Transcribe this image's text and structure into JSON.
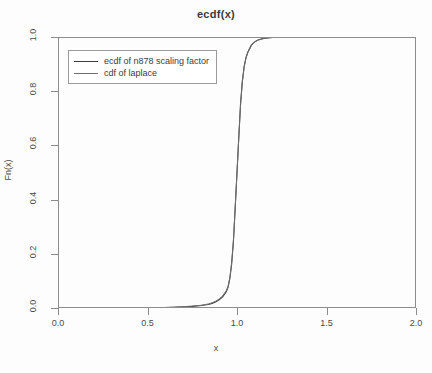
{
  "chart_data": {
    "type": "line",
    "title": "ecdf(x)",
    "xlabel": "x",
    "ylabel": "Fn(x)",
    "xlim": [
      0.0,
      2.0
    ],
    "ylim": [
      0.0,
      1.0
    ],
    "grid": false,
    "legend_position": "top-left",
    "xticks": [
      "0.0",
      "0.5",
      "1.0",
      "1.5",
      "2.0"
    ],
    "xtick_values": [
      0.0,
      0.5,
      1.0,
      1.5,
      2.0
    ],
    "yticks": [
      "0.0",
      "0.2",
      "0.4",
      "0.6",
      "0.8",
      "1.0"
    ],
    "ytick_values": [
      0.0,
      0.2,
      0.4,
      0.6,
      0.8,
      1.0
    ],
    "series": [
      {
        "name": "ecdf of n878 scaling factor",
        "color": "#3c3c3c",
        "linestyle": "solid",
        "x": [
          0.0,
          0.1,
          0.2,
          0.3,
          0.4,
          0.5,
          0.6,
          0.65,
          0.7,
          0.75,
          0.8,
          0.84,
          0.86,
          0.88,
          0.9,
          0.92,
          0.94,
          0.95,
          0.96,
          0.97,
          0.98,
          0.99,
          1.0,
          1.01,
          1.02,
          1.03,
          1.04,
          1.05,
          1.06,
          1.08,
          1.1,
          1.12,
          1.15,
          1.18,
          1.22,
          1.28,
          1.35,
          1.45,
          1.6,
          1.8,
          2.0
        ],
        "y": [
          0.0,
          0.0,
          0.0,
          0.0,
          0.001,
          0.001,
          0.002,
          0.003,
          0.004,
          0.006,
          0.009,
          0.013,
          0.017,
          0.022,
          0.03,
          0.041,
          0.06,
          0.076,
          0.108,
          0.162,
          0.245,
          0.37,
          0.5,
          0.63,
          0.755,
          0.838,
          0.892,
          0.924,
          0.944,
          0.97,
          0.983,
          0.99,
          0.995,
          0.997,
          0.999,
          0.999,
          1.0,
          1.0,
          1.0,
          1.0,
          1.0
        ]
      },
      {
        "name": "cdf of laplace",
        "color": "#6e6e6e",
        "linestyle": "solid",
        "x": [
          0.0,
          0.1,
          0.2,
          0.3,
          0.4,
          0.5,
          0.6,
          0.65,
          0.7,
          0.75,
          0.8,
          0.84,
          0.86,
          0.88,
          0.9,
          0.92,
          0.94,
          0.95,
          0.96,
          0.97,
          0.98,
          0.99,
          1.0,
          1.01,
          1.02,
          1.03,
          1.04,
          1.05,
          1.06,
          1.08,
          1.1,
          1.12,
          1.15,
          1.18,
          1.22,
          1.28,
          1.35,
          1.45,
          1.6,
          1.8,
          2.0
        ],
        "y": [
          0.0,
          0.0,
          0.0,
          0.0,
          0.001,
          0.001,
          0.002,
          0.003,
          0.005,
          0.007,
          0.01,
          0.015,
          0.019,
          0.025,
          0.033,
          0.045,
          0.064,
          0.08,
          0.112,
          0.166,
          0.248,
          0.372,
          0.5,
          0.628,
          0.752,
          0.834,
          0.889,
          0.921,
          0.941,
          0.968,
          0.982,
          0.989,
          0.995,
          0.997,
          0.999,
          0.999,
          1.0,
          1.0,
          1.0,
          1.0,
          1.0
        ]
      }
    ]
  },
  "axes": {
    "title": "ecdf(x)",
    "x_axis_label": "x",
    "y_axis_label": "Fn(x)"
  },
  "legend": {
    "entries": [
      {
        "label": "ecdf of n878 scaling factor"
      },
      {
        "label": "cdf of laplace"
      }
    ]
  }
}
